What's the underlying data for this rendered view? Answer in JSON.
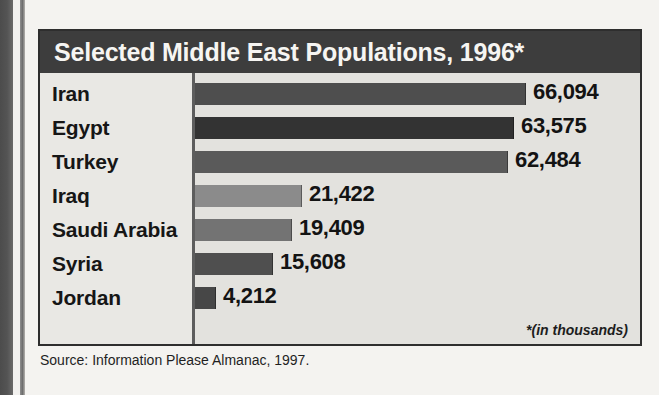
{
  "page": {
    "background_color": "#f4f3f0",
    "gutter_color": "#4c4c4c",
    "source_note": "Source: Information Please Almanac, 1997."
  },
  "chart_box": {
    "title": "Selected Middle East Populations, 1996*",
    "title_bar_color": "#3d3d3d",
    "title_text_color": "#f6f5f2",
    "plot_background_color": "#e3e2de",
    "label_column_color": "#e9e8e4",
    "axis_line_color": "#5d5d5d",
    "footnote": "*(in thousands)"
  },
  "chart_data": {
    "type": "bar",
    "orientation": "horizontal",
    "title": "Selected Middle East Populations, 1996*",
    "xlabel": "",
    "ylabel": "",
    "unit_note": "*(in thousands)",
    "grid": false,
    "legend": null,
    "xlim": [
      0,
      70000
    ],
    "categories": [
      "Iran",
      "Egypt",
      "Turkey",
      "Iraq",
      "Saudi Arabia",
      "Syria",
      "Jordan"
    ],
    "values": [
      66094,
      63575,
      62484,
      21422,
      19409,
      15608,
      4212
    ],
    "value_labels": [
      "66,094",
      "63,575",
      "62,484",
      "21,422",
      "19,409",
      "15,608",
      "4,212"
    ],
    "bar_colors": [
      "#4e4e4e",
      "#333333",
      "#5a5a5a",
      "#8b8b8b",
      "#737373",
      "#4f4f4f",
      "#474747"
    ],
    "bars": [
      {
        "category": "Iran",
        "value": 66094,
        "label": "66,094",
        "color": "#4e4e4e"
      },
      {
        "category": "Egypt",
        "value": 63575,
        "label": "63,575",
        "color": "#333333"
      },
      {
        "category": "Turkey",
        "value": 62484,
        "label": "62,484",
        "color": "#5a5a5a"
      },
      {
        "category": "Iraq",
        "value": 21422,
        "label": "21,422",
        "color": "#8b8b8b"
      },
      {
        "category": "Saudi Arabia",
        "value": 19409,
        "label": "19,409",
        "color": "#737373"
      },
      {
        "category": "Syria",
        "value": 15608,
        "label": "15,608",
        "color": "#4f4f4f"
      },
      {
        "category": "Jordan",
        "value": 4212,
        "label": "4,212",
        "color": "#474747"
      }
    ]
  }
}
